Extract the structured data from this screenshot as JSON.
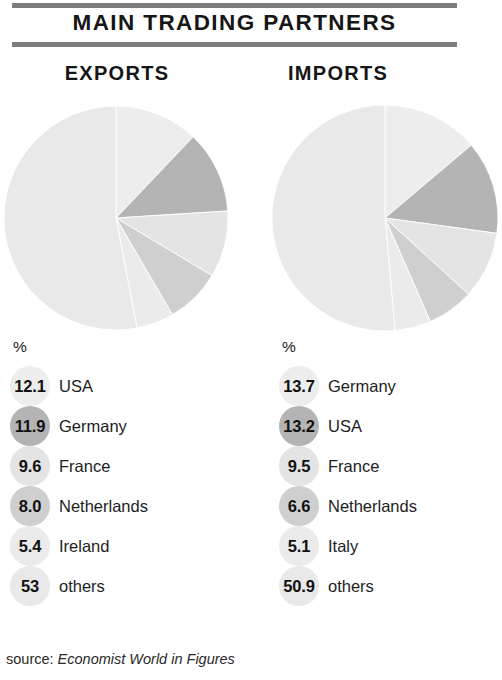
{
  "header": {
    "title": "MAIN TRADING PARTNERS"
  },
  "panels": {
    "exports": {
      "heading": "EXPORTS",
      "unit_label": "%"
    },
    "imports": {
      "heading": "IMPORTS",
      "unit_label": "%"
    }
  },
  "source": {
    "prefix": "source: ",
    "title": "Economist World in Figures"
  },
  "colors": {
    "rule": "#7d7d7d",
    "text": "#161616",
    "shade_lightest": "#ededed",
    "shade_light": "#e4e4e4",
    "shade_mid_light": "#dcdcdc",
    "shade_mid": "#cfcfcf",
    "shade_dark": "#b4b4b4",
    "shade_others": "#e9e9e9"
  },
  "chart_data": [
    {
      "type": "pie",
      "title": "EXPORTS",
      "unit": "%",
      "start_angle_deg": 0,
      "direction": "clockwise",
      "categories": [
        "USA",
        "Germany",
        "France",
        "Netherlands",
        "Ireland",
        "others"
      ],
      "values": [
        12.1,
        11.9,
        9.6,
        8.0,
        5.4,
        53
      ],
      "value_labels": [
        "12.1",
        "11.9",
        "9.6",
        "8.0",
        "5.4",
        "53"
      ],
      "slice_colors": [
        "#ededed",
        "#b4b4b4",
        "#e4e4e4",
        "#cfcfcf",
        "#ebebeb",
        "#e9e9e9"
      ],
      "legend_position": "below"
    },
    {
      "type": "pie",
      "title": "IMPORTS",
      "unit": "%",
      "start_angle_deg": 0,
      "direction": "clockwise",
      "categories": [
        "Germany",
        "USA",
        "France",
        "Netherlands",
        "Italy",
        "others"
      ],
      "values": [
        13.7,
        13.2,
        9.5,
        6.6,
        5.1,
        50.9
      ],
      "value_labels": [
        "13.7",
        "13.2",
        "9.5",
        "6.6",
        "5.1",
        "50.9"
      ],
      "slice_colors": [
        "#ededed",
        "#b4b4b4",
        "#e4e4e4",
        "#cfcfcf",
        "#ebebeb",
        "#e9e9e9"
      ],
      "legend_position": "below"
    }
  ]
}
